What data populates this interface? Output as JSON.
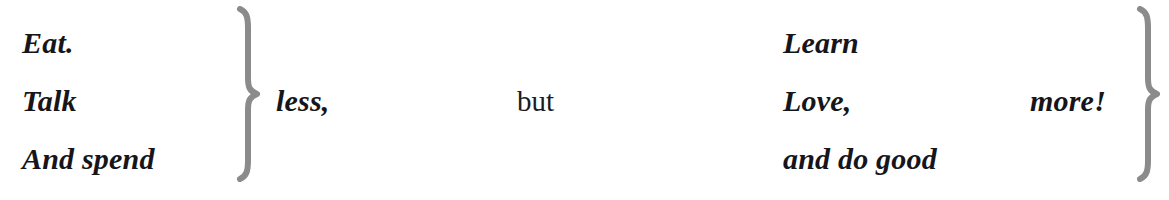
{
  "document": {
    "type": "typographic-aphorism",
    "background_color": "#ffffff",
    "text_color": "#16161a",
    "brace_color": "#8b8b8b",
    "full_text": "Eat. Talk And spend } less, but Learn Love, and do good } more!"
  },
  "left_group": {
    "lines": [
      {
        "text": "Eat."
      },
      {
        "text": "Talk"
      },
      {
        "text": "And spend"
      }
    ],
    "brace": "}",
    "quantifier": "less,"
  },
  "conjunction": {
    "text": "but"
  },
  "right_group": {
    "lines": [
      {
        "text": "Learn"
      },
      {
        "text": "Love,"
      },
      {
        "text": "and do good"
      }
    ],
    "brace": "}",
    "quantifier": "more!"
  }
}
